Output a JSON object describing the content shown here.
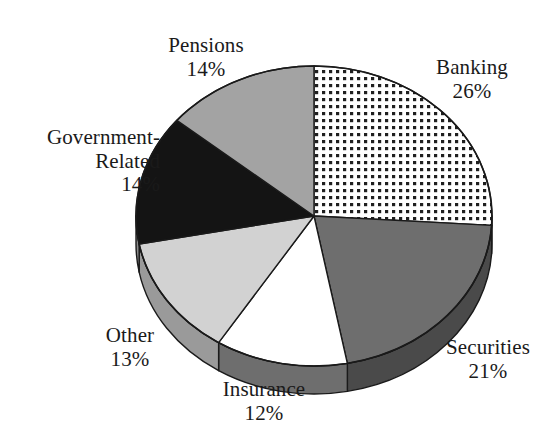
{
  "chart_data": {
    "type": "pie",
    "title": "",
    "subtitle": "",
    "xlabel": "",
    "ylabel": "",
    "three_d": true,
    "start_angle_deg": 0,
    "direction": "clockwise",
    "legend_position": "none",
    "grid": false,
    "categories": [
      "Banking",
      "Securities",
      "Insurance",
      "Other",
      "Government-Related",
      "Pensions"
    ],
    "values": [
      26,
      21,
      12,
      13,
      14,
      14
    ],
    "value_unit": "%",
    "slices": [
      {
        "name": "Banking",
        "label_line1": "Banking",
        "label_line2": "26%",
        "value": 26,
        "fill_style": "dotted-grid",
        "fill_color": "#ffffff",
        "pattern_color": "#1a1a1a",
        "side_color": "#8c8c8c"
      },
      {
        "name": "Securities",
        "label_line1": "Securities",
        "label_line2": "21%",
        "value": 21,
        "fill_style": "solid",
        "fill_color": "#6e6e6e",
        "pattern_color": "",
        "side_color": "#4a4a4a"
      },
      {
        "name": "Insurance",
        "label_line1": "Insurance",
        "label_line2": "12%",
        "value": 12,
        "fill_style": "solid",
        "fill_color": "#ffffff",
        "pattern_color": "",
        "side_color": "#6e6e6e"
      },
      {
        "name": "Other",
        "label_line1": "Other",
        "label_line2": "13%",
        "value": 13,
        "fill_style": "solid",
        "fill_color": "#d2d2d2",
        "pattern_color": "",
        "side_color": "#9a9a9a"
      },
      {
        "name": "Government-Related",
        "label_line1": "Government-",
        "label_line2": "Related",
        "label_line3": "14%",
        "value": 14,
        "fill_style": "solid",
        "fill_color": "#141414",
        "pattern_color": "",
        "side_color": "#8c8c8c"
      },
      {
        "name": "Pensions",
        "label_line1": "Pensions",
        "label_line2": "14%",
        "value": 14,
        "fill_style": "solid",
        "fill_color": "#a3a3a3",
        "pattern_color": "",
        "side_color": "#8c8c8c"
      }
    ]
  },
  "geometry": {
    "center_x": 314,
    "center_y": 216,
    "radius_x": 178,
    "radius_y": 150,
    "depth": 28
  },
  "colors": {
    "background": "#ffffff",
    "outline": "#1a1a1a",
    "text": "#1a1a1a"
  }
}
